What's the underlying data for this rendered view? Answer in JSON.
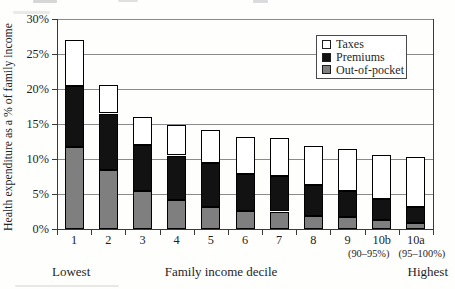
{
  "chart_data": {
    "type": "bar",
    "stacked": true,
    "title": "",
    "ylabel": "Health expenditure as a % of family income",
    "xlabel": "Family income decile",
    "ylim": [
      0,
      30
    ],
    "ytick_step": 5,
    "ytick_suffix": "%",
    "grid": true,
    "plot_border": "left-right-bottom",
    "categories": [
      "1",
      "2",
      "3",
      "4",
      "5",
      "6",
      "7",
      "8",
      "9",
      "10b",
      "10a"
    ],
    "category_sublabels": [
      "",
      "",
      "",
      "",
      "",
      "",
      "",
      "",
      "",
      "(90–95%)",
      "(95–100%)"
    ],
    "series": [
      {
        "name": "Out-of-pocket",
        "color": "#7f7f7f",
        "values": [
          11.7,
          8.4,
          5.4,
          4.2,
          3.2,
          2.6,
          2.5,
          1.9,
          1.7,
          1.3,
          0.9
        ]
      },
      {
        "name": "Premiums",
        "color": "#121212",
        "values": [
          8.7,
          8.1,
          6.6,
          6.3,
          6.2,
          5.3,
          5.1,
          4.4,
          3.7,
          3.0,
          2.3
        ]
      },
      {
        "name": "Taxes",
        "color": "#ffffff",
        "values": [
          6.6,
          4.1,
          4.0,
          4.4,
          4.8,
          5.2,
          5.4,
          5.5,
          6.0,
          6.3,
          7.1
        ]
      }
    ],
    "totals": [
      27.0,
      20.6,
      16.0,
      14.9,
      14.2,
      13.1,
      13.0,
      11.8,
      11.4,
      10.6,
      10.3
    ],
    "legend": {
      "position": "top-right",
      "items": [
        "Taxes",
        "Premiums",
        "Out-of-pocket"
      ]
    },
    "annotations": {
      "left": "Lowest",
      "right": "Highest"
    },
    "colors": {
      "taxes_fill": "#ffffff",
      "premiums_fill": "#121212",
      "out_of_pocket_fill": "#7f7f7f",
      "bar_outline": "#000000",
      "gridline": "#8a8a8a",
      "axis": "#3a3a3a",
      "text": "#1f1f1f",
      "background": "#fefefd"
    }
  }
}
